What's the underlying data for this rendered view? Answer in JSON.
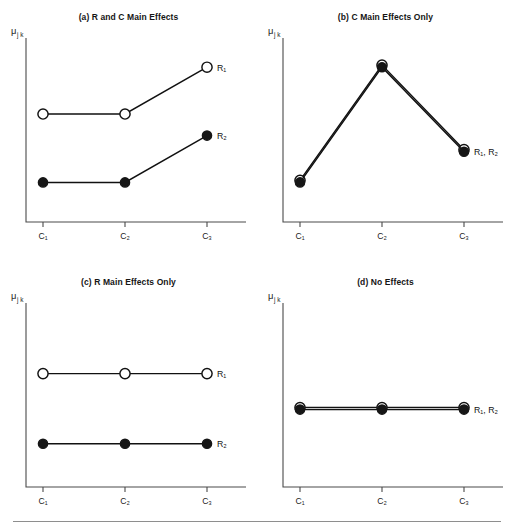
{
  "figure": {
    "ylabel": "μ",
    "ylabel_subscript": "j k",
    "footer_rule": true
  },
  "chart_data": [
    {
      "type": "line",
      "panel_id": "a",
      "title": "(a) R and C Main Effects",
      "categories": [
        "C₁",
        "C₂",
        "C₃"
      ],
      "xlabel": "",
      "ylabel": "μ j k",
      "ylim": [
        0,
        10
      ],
      "grid": false,
      "legend_position": "right-of-last-point",
      "series": [
        {
          "name": "R₁",
          "marker": "open",
          "values": [
            6.0,
            6.0,
            8.6
          ],
          "label": "R₁"
        },
        {
          "name": "R₂",
          "marker": "filled",
          "values": [
            2.2,
            2.2,
            4.8
          ],
          "label": "R₂"
        }
      ],
      "annotations": [
        "R₁",
        "R₂"
      ]
    },
    {
      "type": "line",
      "panel_id": "b",
      "title": "(b) C Main Effects Only",
      "categories": [
        "C₁",
        "C₂",
        "C₃"
      ],
      "xlabel": "",
      "ylabel": "μ j k",
      "ylim": [
        0,
        10
      ],
      "grid": false,
      "legend_position": "right-of-last-point",
      "series": [
        {
          "name": "R₁",
          "marker": "open",
          "values": [
            2.2,
            8.6,
            3.9
          ],
          "label": ""
        },
        {
          "name": "R₂",
          "marker": "filled",
          "values": [
            2.2,
            8.6,
            3.9
          ],
          "label": "R₁, R₂"
        }
      ],
      "annotations": [
        "R₁, R₂"
      ],
      "note": "R1 and R2 coincide; open markers drawn behind filled markers"
    },
    {
      "type": "line",
      "panel_id": "c",
      "title": "(c) R Main Effects Only",
      "categories": [
        "C₁",
        "C₂",
        "C₃"
      ],
      "xlabel": "",
      "ylabel": "μ j k",
      "ylim": [
        0,
        10
      ],
      "grid": false,
      "legend_position": "right-of-last-point",
      "series": [
        {
          "name": "R₁",
          "marker": "open",
          "values": [
            6.3,
            6.3,
            6.3
          ],
          "label": "R₁"
        },
        {
          "name": "R₂",
          "marker": "filled",
          "values": [
            2.4,
            2.4,
            2.4
          ],
          "label": "R₂"
        }
      ],
      "annotations": [
        "R₁",
        "R₂"
      ]
    },
    {
      "type": "line",
      "panel_id": "d",
      "title": "(d) No Effects",
      "categories": [
        "C₁",
        "C₂",
        "C₃"
      ],
      "xlabel": "",
      "ylabel": "μ j k",
      "ylim": [
        0,
        10
      ],
      "grid": false,
      "legend_position": "right-of-last-point",
      "series": [
        {
          "name": "R₁",
          "marker": "open",
          "values": [
            4.3,
            4.3,
            4.3
          ],
          "label": ""
        },
        {
          "name": "R₂",
          "marker": "filled",
          "values": [
            4.3,
            4.3,
            4.3
          ],
          "label": "R₁, R₂"
        }
      ],
      "annotations": [
        "R₁, R₂"
      ],
      "note": "R1 and R2 coincide; open markers drawn behind filled markers"
    }
  ]
}
